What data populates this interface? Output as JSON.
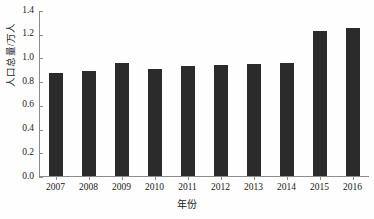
{
  "chart_data": {
    "type": "bar",
    "title": "",
    "xlabel": "年份",
    "ylabel": "人口总量/万人",
    "categories": [
      "2007",
      "2008",
      "2009",
      "2010",
      "2011",
      "2012",
      "2013",
      "2014",
      "2015",
      "2016"
    ],
    "values": [
      0.87,
      0.89,
      0.96,
      0.91,
      0.93,
      0.94,
      0.95,
      0.96,
      1.23,
      1.26
    ],
    "ylim": [
      0.0,
      1.4
    ],
    "yticks": [
      "0.0",
      "0.2",
      "0.4",
      "0.6",
      "0.8",
      "1.0",
      "1.2",
      "1.4"
    ],
    "ytick_values": [
      0.0,
      0.2,
      0.4,
      0.6,
      0.8,
      1.0,
      1.2,
      1.4
    ],
    "grid": false,
    "legend": null,
    "series_color": "#2b2b2b",
    "axis_color": "#8c8c8c"
  },
  "caption": ""
}
